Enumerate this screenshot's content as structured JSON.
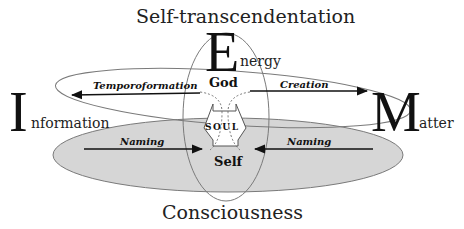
{
  "diagram": {
    "top_label": "Self-transcendentation",
    "bottom_label": "Consciousness",
    "poles": {
      "energy": {
        "initial": "E",
        "rest": "nergy"
      },
      "information": {
        "initial": "I",
        "rest": "nformation"
      },
      "matter": {
        "initial": "M",
        "rest": "atter"
      }
    },
    "nodes": {
      "god": "God",
      "soul": "SOUL",
      "self": "Self"
    },
    "arrows": {
      "temporoformation": "Temporoformation",
      "creation": "Creation",
      "naming_left": "Naming",
      "naming_right": "Naming"
    },
    "colors": {
      "lower_ellipse_fill": "#d6d6d6",
      "outline": "#6e6e6e",
      "arrow": "#111111",
      "background": "#ffffff"
    }
  }
}
